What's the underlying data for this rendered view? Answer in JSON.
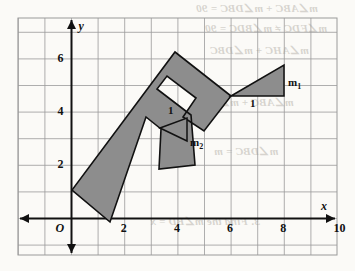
{
  "figure": {
    "kind": "coordinate-grid-with-polygon",
    "grid": {
      "left_px": 18,
      "top_px": 18,
      "right_px": 337,
      "bottom_px": 255,
      "cell_px": 26.6,
      "origin_px": {
        "x": 71.5,
        "y": 218.5
      },
      "color": "#9a9a9a",
      "show": true
    },
    "axes": {
      "x_label": "x",
      "y_label": "y",
      "origin_label": "O",
      "color": "#111111",
      "x_ticks": [
        "2",
        "4",
        "6",
        "8",
        "10"
      ],
      "x_tick_values": [
        2,
        4,
        6,
        8,
        10
      ],
      "y_ticks": [
        "2",
        "4",
        "6"
      ],
      "y_tick_values": [
        2,
        4,
        6
      ]
    },
    "polygon": {
      "name": "rotated-f-shape",
      "fill": "#8d8d8d",
      "stroke": "#111111",
      "stroke_width": 1.6,
      "points_px": "110,222 72,190 175,52 231,96 204,131 183,117 196,98 167,76 157,89 191,115 195,165 159,169 161,129 146,117"
    },
    "triangle_m1": {
      "name": "slope-triangle-m1",
      "fill": "#8d8d8d",
      "stroke": "#111111",
      "points_px": "231,96 284,65 284,96",
      "leg_vertical_label": "m",
      "leg_vertical_sub": "1",
      "leg_horizontal_label": "1"
    },
    "triangle_m2": {
      "name": "slope-triangle-m2",
      "fill": "#8d8d8d",
      "stroke": "#111111",
      "points_px": "160,128 187,118 187,141",
      "leg_vertical_label": "m",
      "leg_vertical_sub": "2",
      "leg_horizontal_label": "1"
    }
  },
  "bleed_text": [
    {
      "text": "m∠ABC + m∠DBC = 90",
      "x": 196,
      "y": 2,
      "size": 11
    },
    {
      "text": "m∠FDC ≠ m∠BDC = 90",
      "x": 205,
      "y": 22,
      "size": 11
    },
    {
      "text": "m∠AHC + m∠DBC",
      "x": 210,
      "y": 44,
      "size": 11
    },
    {
      "text": "m∠ABC + m∠DCC",
      "x": 196,
      "y": 96,
      "size": 11
    },
    {
      "text": "m∠DBC = m",
      "x": 214,
      "y": 145,
      "size": 11
    },
    {
      "text": "3. Find the m∠BD = x",
      "x": 150,
      "y": 215,
      "size": 11
    }
  ]
}
